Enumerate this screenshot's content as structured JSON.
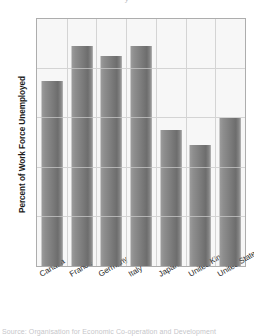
{
  "chart_data": {
    "type": "bar",
    "title": "",
    "xlabel": "",
    "ylabel": "Percent of Work Force Unemployed",
    "ylim": [
      0,
      10
    ],
    "ytick_values": [
      0,
      2,
      4,
      6,
      8,
      10
    ],
    "ytick_labels": [
      "0",
      "2",
      "4",
      "6",
      "8",
      "10"
    ],
    "grid": "both",
    "legend": "none",
    "bar_color": "#7d7d7d",
    "plot_background": "#f7f7f7",
    "grid_color": "#c9c9c9",
    "categories": [
      "Canada",
      "France",
      "Germany",
      "Italy",
      "Japan",
      "United Kingdom",
      "United States"
    ],
    "values": [
      7.5,
      8.9,
      8.5,
      8.9,
      5.5,
      4.9,
      6.0
    ]
  },
  "axes": {
    "y_title": "Percent of Work Force Unemployed"
  },
  "page_fragments": {
    "top_cropped_line": "y",
    "bottom_cropped_line": "Source: Organisation for Economic Co-operation and Development"
  }
}
